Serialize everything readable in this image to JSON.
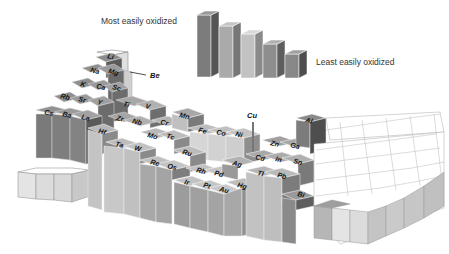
{
  "legend": {
    "most_label": "Most easily oxidized",
    "least_label": "Least easily oxidized",
    "bars": [
      {
        "x": 197,
        "base": 77,
        "h": 66,
        "top": "#9a9a9a",
        "front": "#7c7c7c",
        "side": "#555555"
      },
      {
        "x": 219,
        "base": 78,
        "h": 56,
        "top": "#c4c4c4",
        "front": "#aaaaaa",
        "side": "#777777"
      },
      {
        "x": 241,
        "base": 78,
        "h": 48,
        "top": "#d8d8d8",
        "front": "#c2c2c2",
        "side": "#8a8a8a"
      },
      {
        "x": 263,
        "base": 78,
        "h": 38,
        "top": "#b0b0b0",
        "front": "#8e8e8e",
        "side": "#5e5e5e"
      },
      {
        "x": 285,
        "base": 78,
        "h": 28,
        "top": "#a0a0a0",
        "front": "#888888",
        "side": "#4e4e4e"
      }
    ]
  },
  "callouts": [
    {
      "label": "Be",
      "x": 150,
      "y": 75
    },
    {
      "label": "Cu",
      "x": 248,
      "y": 117
    }
  ],
  "blocks": [
    {
      "sym": "",
      "x": 37,
      "y": 60,
      "h": 8,
      "shade": "white"
    },
    {
      "sym": "Li",
      "x": 30,
      "y": 63,
      "h": 30,
      "shade": "dark"
    },
    {
      "sym": "Na",
      "x": 16,
      "y": 76,
      "h": 28,
      "shade": "dark"
    },
    {
      "sym": "Mg",
      "x": 30,
      "y": 78,
      "h": 26,
      "shade": "mid"
    },
    {
      "sym": "K",
      "x": 3,
      "y": 88,
      "h": 30,
      "shade": "dark"
    },
    {
      "sym": "Ca",
      "x": 18,
      "y": 91,
      "h": 28,
      "shade": "dark"
    },
    {
      "sym": "Sc",
      "x": 33,
      "y": 93,
      "h": 26,
      "shade": "mid"
    },
    {
      "sym": "Rb",
      "x": -10,
      "y": 101,
      "h": 32,
      "shade": "dark"
    },
    {
      "sym": "Sr",
      "x": 5,
      "y": 104,
      "h": 30,
      "shade": "dark"
    },
    {
      "sym": "Y",
      "x": 20,
      "y": 106,
      "h": 28,
      "shade": "mid"
    }
  ],
  "elements": [
    {
      "sym": "Li",
      "tx": 107,
      "ty": 58
    },
    {
      "sym": "Na",
      "tx": 90,
      "ty": 72
    },
    {
      "sym": "Mg",
      "tx": 108,
      "ty": 73
    },
    {
      "sym": "K",
      "tx": 80,
      "ty": 86
    },
    {
      "sym": "Ca",
      "tx": 96,
      "ty": 88
    },
    {
      "sym": "Sc",
      "tx": 112,
      "ty": 89
    },
    {
      "sym": "Rb",
      "tx": 60,
      "ty": 98
    },
    {
      "sym": "Sr",
      "tx": 78,
      "ty": 101
    },
    {
      "sym": "Y",
      "tx": 97,
      "ty": 104
    },
    {
      "sym": "Cs",
      "tx": 44,
      "ty": 114
    },
    {
      "sym": "Ba",
      "tx": 62,
      "ty": 116
    },
    {
      "sym": "La",
      "tx": 81,
      "ty": 119
    },
    {
      "sym": "Ti",
      "tx": 123,
      "ty": 106
    },
    {
      "sym": "V",
      "tx": 145,
      "ty": 108
    },
    {
      "sym": "Zr",
      "tx": 116,
      "ty": 120
    },
    {
      "sym": "Nb",
      "tx": 132,
      "ty": 123
    },
    {
      "sym": "Hf",
      "tx": 98,
      "ty": 133
    },
    {
      "sym": "Ta",
      "tx": 115,
      "ty": 146
    },
    {
      "sym": "W",
      "tx": 134,
      "ty": 150
    },
    {
      "sym": "Cr",
      "tx": 160,
      "ty": 124
    },
    {
      "sym": "Mo",
      "tx": 147,
      "ty": 137
    },
    {
      "sym": "Tc",
      "tx": 166,
      "ty": 138
    },
    {
      "sym": "Mn",
      "tx": 179,
      "ty": 117
    },
    {
      "sym": "Fe",
      "tx": 198,
      "ty": 132
    },
    {
      "sym": "Co",
      "tx": 216,
      "ty": 134
    },
    {
      "sym": "Ni",
      "tx": 235,
      "ty": 136
    },
    {
      "sym": "Ru",
      "tx": 182,
      "ty": 154
    },
    {
      "sym": "Rh",
      "tx": 196,
      "ty": 172
    },
    {
      "sym": "Pd",
      "tx": 214,
      "ty": 175
    },
    {
      "sym": "Ag",
      "tx": 232,
      "ty": 165
    },
    {
      "sym": "Re",
      "tx": 150,
      "ty": 164
    },
    {
      "sym": "Os",
      "tx": 167,
      "ty": 168
    },
    {
      "sym": "Ir",
      "tx": 184,
      "ty": 184
    },
    {
      "sym": "Pt",
      "tx": 203,
      "ty": 187
    },
    {
      "sym": "Au",
      "tx": 219,
      "ty": 191
    },
    {
      "sym": "Hg",
      "tx": 237,
      "ty": 187
    },
    {
      "sym": "Zn",
      "tx": 270,
      "ty": 145
    },
    {
      "sym": "Ga",
      "tx": 290,
      "ty": 147
    },
    {
      "sym": "Cd",
      "tx": 255,
      "ty": 159
    },
    {
      "sym": "In",
      "tx": 275,
      "ty": 161
    },
    {
      "sym": "Sn",
      "tx": 293,
      "ty": 163
    },
    {
      "sym": "Tl",
      "tx": 257,
      "ty": 175
    },
    {
      "sym": "Pb",
      "tx": 277,
      "ty": 177
    },
    {
      "sym": "Al",
      "tx": 305,
      "ty": 122
    },
    {
      "sym": "Bi",
      "tx": 297,
      "ty": 196
    }
  ]
}
